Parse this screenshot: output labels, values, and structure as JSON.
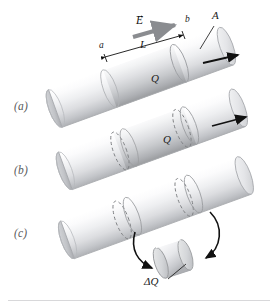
{
  "figure": {
    "background_color": "#ffffff",
    "width": 278,
    "height": 307
  },
  "panels": [
    {
      "id": "a",
      "label": "(a)",
      "x": 14,
      "y": 100
    },
    {
      "id": "b",
      "label": "(b)",
      "x": 14,
      "y": 164
    },
    {
      "id": "c",
      "label": "(c)",
      "x": 14,
      "y": 227
    }
  ],
  "annotations": {
    "field_vector": {
      "label": "E",
      "accent": "vector-arrow",
      "x": 136,
      "y": 16
    },
    "length": {
      "label": "L",
      "x": 140,
      "y": 43
    },
    "left_bound": {
      "label": "a",
      "x": 101,
      "y": 49
    },
    "right_bound": {
      "label": "b",
      "x": 186,
      "y": 21
    },
    "area": {
      "label": "A",
      "x": 214,
      "y": 14
    },
    "charge_a": {
      "label": "Q",
      "x": 152,
      "y": 77
    },
    "charge_b": {
      "label": "Q",
      "x": 164,
      "y": 137
    },
    "delta_charge": {
      "label": "ΔQ",
      "x": 148,
      "y": 281
    }
  },
  "colors": {
    "cylinder_light": "#fdfdfd",
    "cylinder_mid": "#e3e4e6",
    "cylinder_shadow": "#b9babd",
    "cylinder_dark": "#8e9094",
    "outline": "#9a9c9f",
    "dashed_ring": "#7d7f83",
    "arrow_black": "#111111",
    "field_arrow": "#8a8c90",
    "panel_label": "#59595b",
    "footer_rule": "#d8d8da"
  },
  "shapes": {
    "cylinder_count": 3,
    "rings_per_cylinder": {
      "a": 2,
      "b": 3,
      "c": 4
    },
    "disk_label": "ΔQ",
    "curved_arrows": 2
  }
}
